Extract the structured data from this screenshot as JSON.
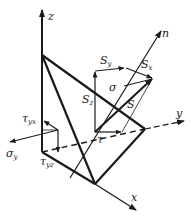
{
  "diagram": {
    "type": "stress-tetrahedron",
    "colors": {
      "ink": "#1a1a1a",
      "background": "#ffffff"
    },
    "axes": {
      "z": "z",
      "y": "y",
      "x": "x",
      "n": "n"
    },
    "vectors": {
      "S": "S",
      "Sx": {
        "base": "S",
        "sub": "x"
      },
      "Sy": {
        "base": "S",
        "sub": "y"
      },
      "Sz": {
        "base": "S",
        "sub": "z"
      },
      "sigma": "σ",
      "tau": "τ",
      "sigma_y": {
        "base": "σ",
        "sub": "y"
      },
      "tau_yx": {
        "base": "τ",
        "sub": "yx"
      },
      "tau_yz": {
        "base": "τ",
        "sub": "yz"
      }
    }
  }
}
